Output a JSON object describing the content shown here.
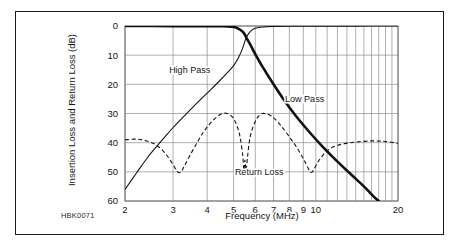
{
  "figure": {
    "id_label": "HBK0071"
  },
  "chart_data": {
    "type": "line",
    "title": "",
    "xlabel": "Frequency (MHz)",
    "ylabel": "Insertion Loss and Return Loss (dB)",
    "xscale": "log",
    "xlim": [
      2,
      20
    ],
    "ylim": [
      0,
      60
    ],
    "y_inverted": true,
    "grid": true,
    "legend_position": "inline-annotations",
    "xticks": [
      2,
      3,
      4,
      5,
      6,
      7,
      8,
      9,
      10,
      20
    ],
    "xtick_labels": [
      "2",
      "3",
      "4",
      "5",
      "6",
      "7",
      "8",
      "9",
      "10",
      "20"
    ],
    "yticks": [
      0,
      10,
      20,
      30,
      40,
      50,
      60
    ],
    "ytick_labels": [
      "0",
      "10",
      "20",
      "30",
      "40",
      "50",
      "60"
    ],
    "annotations": [
      {
        "text": "High Pass",
        "x": 3.45,
        "y": 15
      },
      {
        "text": "Low Pass",
        "x": 9.1,
        "y": 25
      },
      {
        "text": "Return Loss",
        "x": 6.2,
        "y": 50
      }
    ],
    "series": [
      {
        "name": "High Pass",
        "style": "solid-thin",
        "points": [
          [
            2.0,
            56.0
          ],
          [
            2.2,
            50.5
          ],
          [
            2.4,
            45.5
          ],
          [
            2.6,
            41.5
          ],
          [
            2.8,
            38.0
          ],
          [
            3.0,
            34.8
          ],
          [
            3.3,
            30.8
          ],
          [
            3.6,
            27.2
          ],
          [
            4.0,
            23.0
          ],
          [
            4.4,
            19.2
          ],
          [
            4.8,
            15.5
          ],
          [
            5.0,
            13.6
          ],
          [
            5.2,
            11.0
          ],
          [
            5.4,
            7.5
          ],
          [
            5.5,
            5.2
          ],
          [
            5.6,
            3.4
          ],
          [
            5.8,
            1.6
          ],
          [
            6.0,
            0.8
          ],
          [
            6.4,
            0.35
          ],
          [
            7.0,
            0.15
          ],
          [
            8.0,
            0.08
          ],
          [
            10.0,
            0.05
          ],
          [
            14.0,
            0.03
          ],
          [
            20.0,
            0.02
          ]
        ]
      },
      {
        "name": "Low Pass",
        "style": "solid-thick",
        "points": [
          [
            2.0,
            0.02
          ],
          [
            3.0,
            0.03
          ],
          [
            4.0,
            0.05
          ],
          [
            4.6,
            0.1
          ],
          [
            5.0,
            0.35
          ],
          [
            5.2,
            0.9
          ],
          [
            5.4,
            2.0
          ],
          [
            5.5,
            3.0
          ],
          [
            5.6,
            4.4
          ],
          [
            5.8,
            7.0
          ],
          [
            6.0,
            9.6
          ],
          [
            6.4,
            14.2
          ],
          [
            7.0,
            20.0
          ],
          [
            7.6,
            25.0
          ],
          [
            8.4,
            30.5
          ],
          [
            9.4,
            36.0
          ],
          [
            10.5,
            41.0
          ],
          [
            12.0,
            46.5
          ],
          [
            13.5,
            51.0
          ],
          [
            15.0,
            55.0
          ],
          [
            16.3,
            58.5
          ],
          [
            17.0,
            60.0
          ]
        ]
      },
      {
        "name": "Return Loss",
        "style": "dashed",
        "points": [
          [
            2.0,
            39.0
          ],
          [
            2.2,
            38.8
          ],
          [
            2.4,
            39.4
          ],
          [
            2.6,
            40.8
          ],
          [
            2.8,
            43.5
          ],
          [
            3.0,
            47.5
          ],
          [
            3.1,
            49.8
          ],
          [
            3.2,
            50.2
          ],
          [
            3.3,
            48.0
          ],
          [
            3.5,
            43.5
          ],
          [
            3.7,
            39.5
          ],
          [
            3.9,
            36.0
          ],
          [
            4.1,
            33.4
          ],
          [
            4.3,
            31.5
          ],
          [
            4.5,
            30.2
          ],
          [
            4.7,
            29.9
          ],
          [
            4.9,
            30.8
          ],
          [
            5.05,
            32.5
          ],
          [
            5.2,
            35.5
          ],
          [
            5.3,
            39.0
          ],
          [
            5.4,
            44.5
          ],
          [
            5.45,
            49.5
          ],
          [
            5.5,
            46.0
          ],
          [
            5.55,
            49.5
          ],
          [
            5.62,
            45.0
          ],
          [
            5.7,
            40.0
          ],
          [
            5.8,
            36.5
          ],
          [
            5.95,
            33.5
          ],
          [
            6.1,
            31.5
          ],
          [
            6.3,
            30.2
          ],
          [
            6.5,
            30.0
          ],
          [
            6.8,
            30.6
          ],
          [
            7.1,
            32.0
          ],
          [
            7.5,
            34.5
          ],
          [
            8.0,
            38.0
          ],
          [
            8.5,
            41.5
          ],
          [
            9.0,
            45.5
          ],
          [
            9.4,
            49.0
          ],
          [
            9.6,
            50.2
          ],
          [
            9.8,
            49.5
          ],
          [
            10.2,
            46.5
          ],
          [
            10.8,
            43.5
          ],
          [
            11.5,
            41.6
          ],
          [
            12.5,
            40.5
          ],
          [
            14.0,
            39.8
          ],
          [
            16.0,
            39.4
          ],
          [
            18.0,
            39.6
          ],
          [
            20.0,
            40.2
          ]
        ]
      }
    ]
  }
}
